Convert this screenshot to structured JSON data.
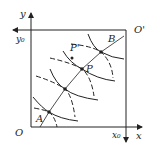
{
  "diagram": {
    "type": "edgeworth-box",
    "labels": {
      "origin": "O",
      "origin_prime": "O'",
      "x_axis": "x",
      "y_axis": "y",
      "x0": "x₀",
      "y0": "y₀",
      "A": "A",
      "B": "B",
      "P": "P",
      "P_prime": "P'"
    },
    "colors": {
      "line": "#222222",
      "background": "#ffffff"
    }
  }
}
